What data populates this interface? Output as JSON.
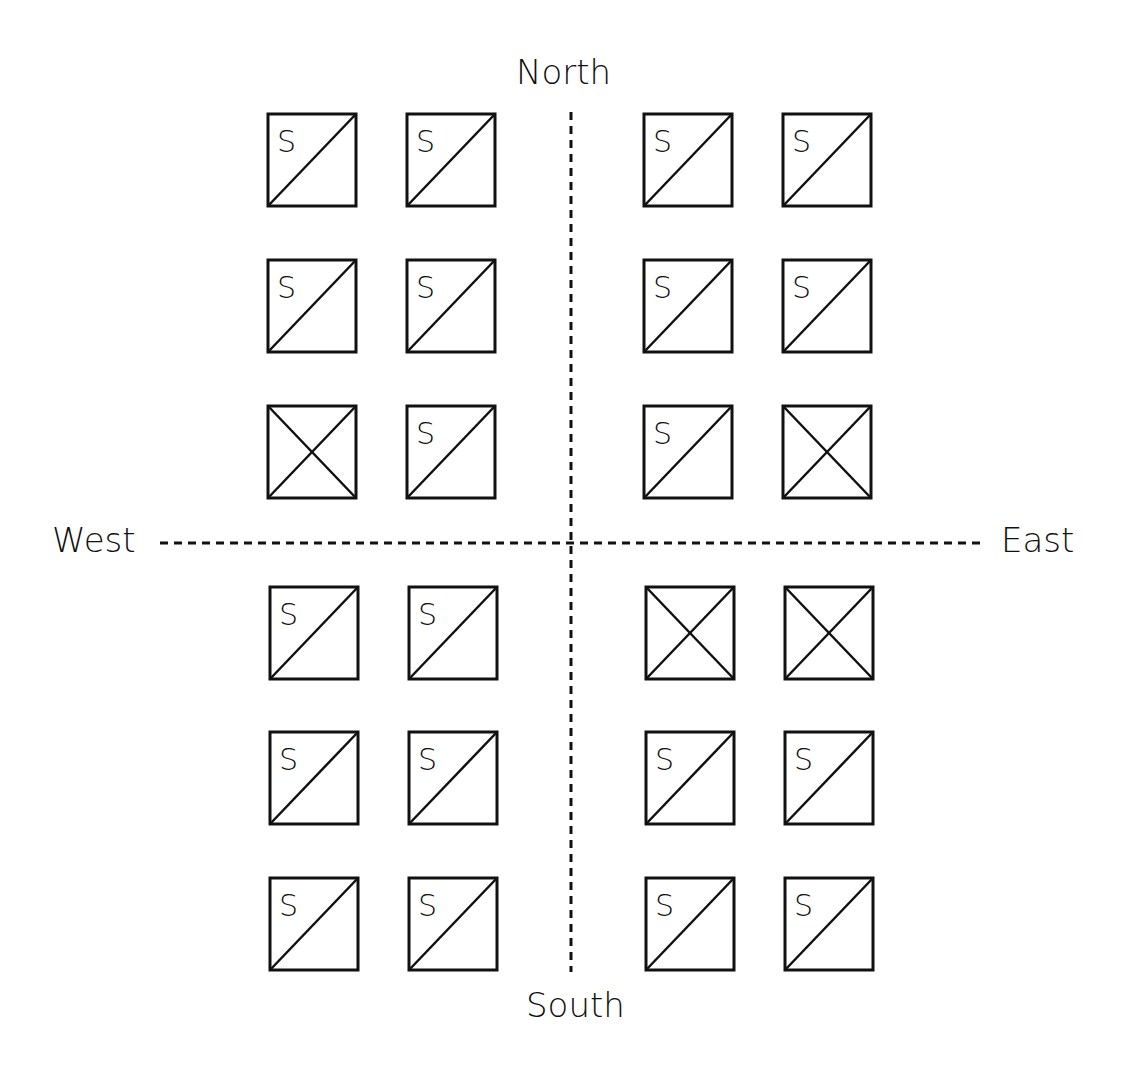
{
  "labels": {
    "north": "North",
    "south": "South",
    "west": "West",
    "east": "East"
  },
  "colors": {
    "stroke": "#111111",
    "background": "#ffffff"
  },
  "axes": {
    "vertical": {
      "x": 571,
      "y1": 112,
      "y2": 972,
      "style": "dashed"
    },
    "horizontal": {
      "y": 543,
      "x1": 160,
      "x2": 985,
      "style": "dashed"
    }
  },
  "grid": {
    "rows": 6,
    "cols": 4,
    "cells": [
      {
        "row": 0,
        "col": 0,
        "type": "S"
      },
      {
        "row": 0,
        "col": 1,
        "type": "S"
      },
      {
        "row": 0,
        "col": 2,
        "type": "S"
      },
      {
        "row": 0,
        "col": 3,
        "type": "S"
      },
      {
        "row": 1,
        "col": 0,
        "type": "S"
      },
      {
        "row": 1,
        "col": 1,
        "type": "S"
      },
      {
        "row": 1,
        "col": 2,
        "type": "S"
      },
      {
        "row": 1,
        "col": 3,
        "type": "S"
      },
      {
        "row": 2,
        "col": 0,
        "type": "X"
      },
      {
        "row": 2,
        "col": 1,
        "type": "S"
      },
      {
        "row": 2,
        "col": 2,
        "type": "S"
      },
      {
        "row": 2,
        "col": 3,
        "type": "X"
      },
      {
        "row": 3,
        "col": 0,
        "type": "S"
      },
      {
        "row": 3,
        "col": 1,
        "type": "S"
      },
      {
        "row": 3,
        "col": 2,
        "type": "X"
      },
      {
        "row": 3,
        "col": 3,
        "type": "X"
      },
      {
        "row": 4,
        "col": 0,
        "type": "S"
      },
      {
        "row": 4,
        "col": 1,
        "type": "S"
      },
      {
        "row": 4,
        "col": 2,
        "type": "S"
      },
      {
        "row": 4,
        "col": 3,
        "type": "S"
      },
      {
        "row": 5,
        "col": 0,
        "type": "S"
      },
      {
        "row": 5,
        "col": 1,
        "type": "S"
      },
      {
        "row": 5,
        "col": 2,
        "type": "S"
      },
      {
        "row": 5,
        "col": 3,
        "type": "S"
      }
    ],
    "cell_letter": "S"
  }
}
